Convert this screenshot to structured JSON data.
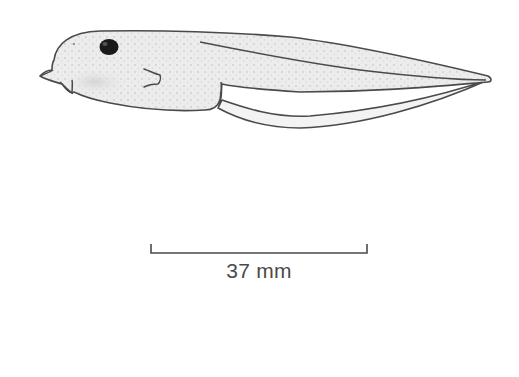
{
  "figure": {
    "outline_color": "#4a4a4a",
    "fill_color": "#e6e6e6",
    "eye_color": "#1a1a1a"
  },
  "scale_bar": {
    "label": "37 mm",
    "color": "#4a4a4a"
  }
}
